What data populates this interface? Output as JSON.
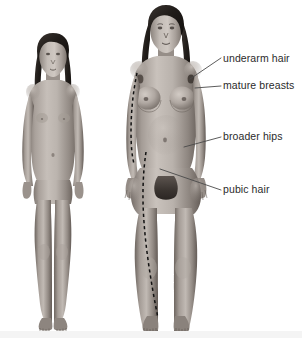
{
  "diagram": {
    "type": "anatomical-comparison-illustration",
    "background_color": "#ffffff",
    "text_color": "#2b2b2b",
    "leader_line_color": "#4a4a4a",
    "dashed_line_color": "#111111",
    "skin_tone_light": "#bdb6b0",
    "skin_tone_mid": "#9a928c",
    "skin_tone_shadow": "#6f6862",
    "hair_color": "#2a2622"
  },
  "figures": [
    {
      "id": "child-figure",
      "name": "prepubescent-female-figure",
      "caption": "",
      "position": "left"
    },
    {
      "id": "adult-figure",
      "name": "post-pubertal-female-figure",
      "caption": "",
      "position": "right"
    }
  ],
  "labels": [
    {
      "id": "underarm-hair",
      "text": "underarm hair"
    },
    {
      "id": "mature-breasts",
      "text": "mature breasts"
    },
    {
      "id": "broader-hips",
      "text": "broader hips"
    },
    {
      "id": "pubic-hair",
      "text": "pubic hair"
    }
  ],
  "annotations": {
    "dashed_outline_torso": "dashed reference line along left side of adult torso",
    "dashed_outline_leg": "dashed reference line along left leg of adult figure"
  }
}
